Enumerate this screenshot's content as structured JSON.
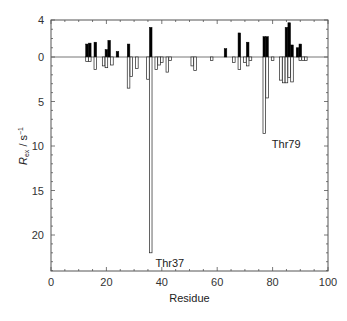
{
  "chart_data": {
    "type": "bar",
    "title": "",
    "xlabel": "Residue",
    "ylabel": "R_ex / s^-1",
    "ylabel_parts": {
      "main": "R",
      "sub": "ex",
      "unit": " / s",
      "sup": "−1"
    },
    "xlim": [
      0,
      100
    ],
    "ylim": [
      4,
      -24
    ],
    "y_inverted": true,
    "grid": false,
    "legend": null,
    "x_ticks": [
      0,
      20,
      40,
      60,
      80,
      100
    ],
    "y_ticks": [
      4,
      0,
      5,
      10,
      15,
      20
    ],
    "y_tick_labels": [
      "4",
      "0",
      "5",
      "10",
      "15",
      "20"
    ],
    "series": [
      {
        "name": "positive (filled)",
        "color": "#000000",
        "fill": "#000000",
        "points": [
          {
            "x": 13,
            "y": 1.4
          },
          {
            "x": 14,
            "y": 1.5
          },
          {
            "x": 16,
            "y": 1.6
          },
          {
            "x": 20,
            "y": 0.8
          },
          {
            "x": 21,
            "y": 1.8
          },
          {
            "x": 24,
            "y": 0.6
          },
          {
            "x": 28,
            "y": 1.4
          },
          {
            "x": 36,
            "y": 3.2
          },
          {
            "x": 63,
            "y": 0.9
          },
          {
            "x": 68,
            "y": 2.6
          },
          {
            "x": 71,
            "y": 1.6
          },
          {
            "x": 77,
            "y": 2.2
          },
          {
            "x": 78,
            "y": 2.2
          },
          {
            "x": 85,
            "y": 3.2
          },
          {
            "x": 86,
            "y": 3.7
          },
          {
            "x": 87,
            "y": 1.3
          },
          {
            "x": 89,
            "y": 1.0
          },
          {
            "x": 90,
            "y": 1.4
          }
        ]
      },
      {
        "name": "negative (open)",
        "color": "#000000",
        "fill": "#ffffff",
        "points": [
          {
            "x": 13,
            "y": 0.5
          },
          {
            "x": 14,
            "y": 0.5
          },
          {
            "x": 16,
            "y": 1.4
          },
          {
            "x": 19,
            "y": 1.0
          },
          {
            "x": 20,
            "y": 1.2
          },
          {
            "x": 22,
            "y": 0.9
          },
          {
            "x": 28,
            "y": 3.5
          },
          {
            "x": 29,
            "y": 2.2
          },
          {
            "x": 31,
            "y": 1.3
          },
          {
            "x": 35,
            "y": 2.5
          },
          {
            "x": 36,
            "y": 22.0
          },
          {
            "x": 38,
            "y": 1.4
          },
          {
            "x": 39,
            "y": 0.9
          },
          {
            "x": 40,
            "y": 0.6
          },
          {
            "x": 42,
            "y": 1.7
          },
          {
            "x": 43,
            "y": 0.4
          },
          {
            "x": 51,
            "y": 1.0
          },
          {
            "x": 52,
            "y": 1.5
          },
          {
            "x": 58,
            "y": 0.4
          },
          {
            "x": 66,
            "y": 0.6
          },
          {
            "x": 68,
            "y": 1.4
          },
          {
            "x": 70,
            "y": 0.6
          },
          {
            "x": 71,
            "y": 1.0
          },
          {
            "x": 72,
            "y": 0.4
          },
          {
            "x": 77,
            "y": 8.6
          },
          {
            "x": 78,
            "y": 4.6
          },
          {
            "x": 80,
            "y": 0.4
          },
          {
            "x": 83,
            "y": 2.6
          },
          {
            "x": 84,
            "y": 2.9
          },
          {
            "x": 85,
            "y": 2.9
          },
          {
            "x": 86,
            "y": 2.3
          },
          {
            "x": 87,
            "y": 2.8
          },
          {
            "x": 90,
            "y": 0.4
          },
          {
            "x": 91,
            "y": 0.4
          },
          {
            "x": 92,
            "y": 0.4
          }
        ]
      }
    ],
    "annotations": [
      {
        "text": "Thr37",
        "x": 37,
        "y": 22.0,
        "side": "below"
      },
      {
        "text": "Thr79",
        "x": 79,
        "y": 8.6,
        "side": "below"
      }
    ]
  },
  "layout": {
    "plot": {
      "left": 51,
      "right": 328,
      "top": 20,
      "zero": 57,
      "bottom": 271
    },
    "px_per_unit_up": 9.25,
    "px_per_unit_down": 8.9,
    "bar_width_px": 2.6
  }
}
